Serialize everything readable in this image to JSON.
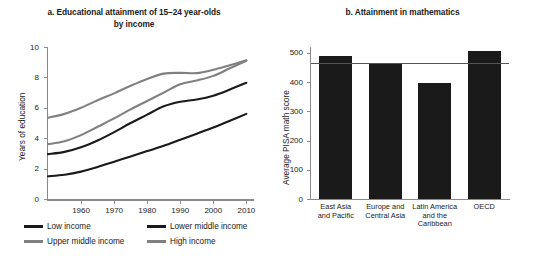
{
  "figure": {
    "footnote": ""
  },
  "panel_a": {
    "title_line1": "a.  Educational attainment of 15–24 year-olds",
    "title_line2": "by income",
    "ylabel": "Years of education",
    "yticks": [
      "0",
      "2",
      "4",
      "6",
      "8",
      "10"
    ],
    "xticks": [
      "1960",
      "1970",
      "1980",
      "1990",
      "2000",
      "2010"
    ],
    "legend": [
      {
        "label": "Low income",
        "color": "#1a1a1a"
      },
      {
        "label": "Lower middle income",
        "color": "#1a1a1a"
      },
      {
        "label": "Upper middle income",
        "color": "#808080"
      },
      {
        "label": "High income",
        "color": "#808080"
      }
    ]
  },
  "panel_b": {
    "title": "b.  Attainment in mathematics",
    "ylabel": "Average PISA math score",
    "yticks": [
      "0",
      "100",
      "200",
      "300",
      "400",
      "500"
    ],
    "categories": [
      "East Asia\nand Pacific",
      "Europe and\nCentral Asia",
      "Latin America\nand the\nCaribbean",
      "OECD"
    ]
  },
  "chart_data": [
    {
      "type": "line",
      "panel": "a",
      "title": "a.  Educational attainment of 15–24 year-olds by income",
      "xlabel": "",
      "ylabel": "Years of education",
      "xlim": [
        1950,
        2012
      ],
      "ylim": [
        0,
        10
      ],
      "xticks": [
        1960,
        1970,
        1980,
        1990,
        2000,
        2010
      ],
      "yticks": [
        0,
        2,
        4,
        6,
        8,
        10
      ],
      "grid": false,
      "legend_position": "below",
      "x": [
        1950,
        1955,
        1960,
        1965,
        1970,
        1975,
        1980,
        1985,
        1990,
        1995,
        2000,
        2005,
        2010
      ],
      "series": [
        {
          "name": "Low income",
          "color": "#1a1a1a",
          "values": [
            1.5,
            1.6,
            1.8,
            2.1,
            2.45,
            2.8,
            3.15,
            3.5,
            3.9,
            4.3,
            4.7,
            5.15,
            5.6
          ]
        },
        {
          "name": "Lower middle income",
          "color": "#1a1a1a",
          "values": [
            2.95,
            3.1,
            3.4,
            3.85,
            4.4,
            5.0,
            5.55,
            6.1,
            6.4,
            6.55,
            6.8,
            7.2,
            7.65
          ]
        },
        {
          "name": "Upper middle income",
          "color": "#808080",
          "values": [
            3.6,
            3.8,
            4.2,
            4.75,
            5.3,
            5.9,
            6.45,
            7.0,
            7.55,
            7.8,
            8.1,
            8.6,
            9.1
          ]
        },
        {
          "name": "High income",
          "color": "#808080",
          "values": [
            5.35,
            5.6,
            6.0,
            6.5,
            6.95,
            7.45,
            7.9,
            8.25,
            8.3,
            8.28,
            8.5,
            8.8,
            9.12
          ]
        }
      ]
    },
    {
      "type": "bar",
      "panel": "b",
      "title": "b.  Attainment in mathematics",
      "xlabel": "",
      "ylabel": "Average PISA math score",
      "ylim": [
        0,
        520
      ],
      "yticks": [
        0,
        100,
        200,
        300,
        400,
        500
      ],
      "grid": false,
      "categories": [
        "East Asia and Pacific",
        "Europe and Central Asia",
        "Latin America and the Caribbean",
        "OECD"
      ],
      "values": [
        490,
        462,
        396,
        505
      ],
      "bar_color": "#1a1a1a",
      "reference_line": {
        "value": 465,
        "color": "#555555"
      }
    }
  ]
}
